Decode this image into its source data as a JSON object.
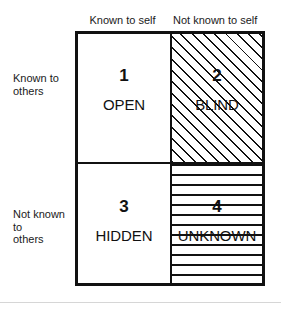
{
  "diagram": {
    "type": "johari-window",
    "column_headers": [
      {
        "id": "known-to-self",
        "label": "Known to self"
      },
      {
        "id": "not-known-to-self",
        "label": "Not known to self"
      }
    ],
    "row_labels": [
      {
        "id": "known-to-others",
        "label": "Known to\nothers",
        "line1": "Known to",
        "line2": "others"
      },
      {
        "id": "not-known-to-others",
        "label": "Not known to\nothers",
        "line1": "Not known to",
        "line2": "others"
      }
    ],
    "quadrants": [
      {
        "id": "open",
        "number": "1",
        "label": "OPEN",
        "row": "known-to-others",
        "column": "known-to-self",
        "fill": "none"
      },
      {
        "id": "blind",
        "number": "2",
        "label": "BLIND",
        "row": "known-to-others",
        "column": "not-known-to-self",
        "fill": "diagonal-hatch"
      },
      {
        "id": "hidden",
        "number": "3",
        "label": "HIDDEN",
        "row": "not-known-to-others",
        "column": "known-to-self",
        "fill": "none"
      },
      {
        "id": "unknown",
        "number": "4",
        "label": "UNKNOWN",
        "row": "not-known-to-others",
        "column": "not-known-to-self",
        "fill": "horizontal-hatch"
      }
    ],
    "colors": {
      "background": "#ffffff",
      "ink": "#111111",
      "text": "#1a1a1a",
      "separator": "#d6d6d6"
    }
  }
}
